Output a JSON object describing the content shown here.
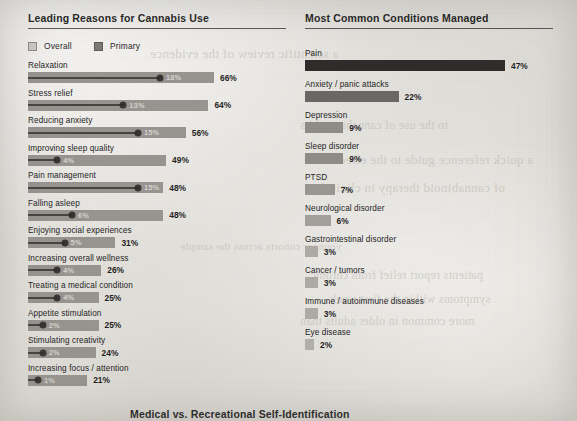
{
  "page": {
    "background_color": "#e8e7e3",
    "bottom_section_title": "Medical vs. Recreational Self-Identification"
  },
  "left_panel": {
    "title": "Leading Reasons for Cannabis Use",
    "legend": [
      {
        "label": "Overall",
        "marker": "square-outline-swatch",
        "color": "#cfccc7"
      },
      {
        "label": "Primary",
        "marker": "square-filled-swatch",
        "color": "#7d7a75"
      }
    ]
  },
  "right_panel": {
    "title": "Most Common Conditions Managed"
  },
  "chart_data": [
    {
      "type": "bar",
      "title": "Leading Reasons for Cannabis Use",
      "orientation": "horizontal",
      "xlabel": "",
      "ylabel": "",
      "xlim": [
        0,
        70
      ],
      "grid": false,
      "legend_position": "top-left",
      "categories": [
        "Relaxation",
        "Stress relief",
        "Reducing anxiety",
        "Improving sleep quality",
        "Pain management",
        "Falling asleep",
        "Enjoying social experiences",
        "Increasing overall wellness",
        "Treating a medical condition",
        "Appetite stimulation",
        "Stimulating creativity",
        "Increasing focus / attention"
      ],
      "series": [
        {
          "name": "Overall",
          "color": "#9b9894",
          "values": [
            66,
            64,
            56,
            49,
            48,
            48,
            31,
            26,
            25,
            25,
            24,
            21
          ],
          "labels": [
            "66%",
            "64%",
            "56%",
            "49%",
            "48%",
            "48%",
            "31%",
            "26%",
            "25%",
            "25%",
            "24%",
            "21%"
          ]
        },
        {
          "name": "Primary",
          "color": "#7d7a75",
          "values": [
            18,
            13,
            15,
            4,
            15,
            6,
            5,
            4,
            4,
            2,
            2,
            1
          ],
          "labels": [
            "18%",
            "13%",
            "15%",
            "4%",
            "15%",
            "6%",
            "5%",
            "4%",
            "4%",
            "2%",
            "2%",
            "1%"
          ]
        }
      ]
    },
    {
      "type": "bar",
      "title": "Most Common Conditions Managed",
      "orientation": "horizontal",
      "xlabel": "",
      "ylabel": "",
      "xlim": [
        0,
        50
      ],
      "grid": false,
      "legend_position": "none",
      "categories": [
        "Pain",
        "Anxiety / panic attacks",
        "Depression",
        "Sleep disorder",
        "PTSD",
        "Neurological disorder",
        "Gastrointestinal disorder",
        "Cancer / tumors",
        "Immune / autoimmune diseases",
        "Eye disease"
      ],
      "values": [
        47,
        22,
        9,
        9,
        7,
        6,
        3,
        3,
        3,
        2
      ],
      "labels": [
        "47%",
        "22%",
        "9%",
        "9%",
        "7%",
        "6%",
        "3%",
        "3%",
        "3%",
        "2%"
      ],
      "bar_colors": [
        "#2e2c2a",
        "#6a6764",
        "#8f8c88",
        "#8f8c88",
        "#9a9793",
        "#a3a09c",
        "#aeaba7",
        "#aeaba7",
        "#aeaba7",
        "#b4b1ad"
      ]
    }
  ],
  "show_through_text": [
    "a scientific review of the evidence",
    "to the use of cannabis and its",
    "a quick reference guide to the effects",
    "of cannabinoid therapy in clinical",
    "patients report relief from chronic",
    "symptoms within the first week",
    "more common in older adults than",
    "younger cohorts across the sample"
  ]
}
